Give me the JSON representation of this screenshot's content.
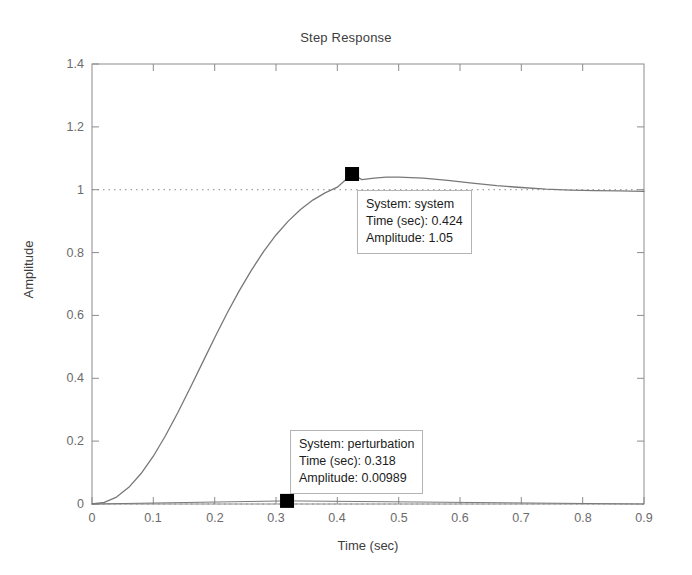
{
  "figure": {
    "title": "Step Response",
    "background_color": "#ffffff",
    "axis_color": "#8c8c8c",
    "curve_color": "#787878",
    "marker_color": "#000000",
    "tick_text_color": "#6b6b6b",
    "label_text_color": "#3d3d3d"
  },
  "chart_data": {
    "type": "line",
    "title": "Step Response",
    "xlabel": "Time (sec)",
    "ylabel": "Amplitude",
    "xlim": [
      0,
      0.9
    ],
    "ylim": [
      0,
      1.4
    ],
    "grid": false,
    "legend": "none",
    "xticks": [
      "0",
      "0.1",
      "0.2",
      "0.3",
      "0.4",
      "0.5",
      "0.6",
      "0.7",
      "0.8",
      "0.9"
    ],
    "xtick_values": [
      0,
      0.1,
      0.2,
      0.3,
      0.4,
      0.5,
      0.6,
      0.7,
      0.8,
      0.9
    ],
    "yticks": [
      "0",
      "0.2",
      "0.4",
      "0.6",
      "0.8",
      "1",
      "1.2",
      "1.4"
    ],
    "ytick_values": [
      0,
      0.2,
      0.4,
      0.6,
      0.8,
      1.0,
      1.2,
      1.4
    ],
    "reference_lines": [
      {
        "name": "steady-state",
        "axis": "y",
        "value": 1.0,
        "style": "dotted"
      },
      {
        "name": "zero-baseline",
        "axis": "y",
        "value": 0.0,
        "style": "dotted"
      }
    ],
    "series": [
      {
        "name": "system",
        "x": [
          0,
          0.02,
          0.04,
          0.06,
          0.08,
          0.1,
          0.12,
          0.14,
          0.16,
          0.18,
          0.2,
          0.22,
          0.24,
          0.26,
          0.28,
          0.3,
          0.32,
          0.34,
          0.36,
          0.38,
          0.4,
          0.424,
          0.44,
          0.46,
          0.48,
          0.5,
          0.54,
          0.58,
          0.62,
          0.66,
          0.7,
          0.74,
          0.78,
          0.82,
          0.86,
          0.9
        ],
        "y": [
          0.0,
          0.005,
          0.022,
          0.053,
          0.097,
          0.152,
          0.218,
          0.291,
          0.369,
          0.449,
          0.529,
          0.606,
          0.678,
          0.744,
          0.804,
          0.856,
          0.9,
          0.937,
          0.967,
          0.99,
          1.008,
          1.05,
          1.032,
          1.037,
          1.04,
          1.04,
          1.037,
          1.03,
          1.021,
          1.013,
          1.007,
          1.002,
          0.999,
          0.997,
          0.996,
          0.995
        ]
      },
      {
        "name": "perturbation",
        "x": [
          0,
          0.318,
          0.9
        ],
        "y": [
          0.0,
          0.00989,
          0.0
        ]
      }
    ],
    "markers": [
      {
        "name": "system-peak-marker",
        "x": 0.424,
        "y": 1.05,
        "shape": "square",
        "color": "#000000"
      },
      {
        "name": "perturbation-marker",
        "x": 0.318,
        "y": 0.00989,
        "shape": "square",
        "color": "#000000"
      }
    ]
  },
  "datatips": [
    {
      "id": "system-datatip",
      "system_label": "System: system",
      "time_label": "Time (sec): 0.424",
      "amplitude_label": "Amplitude: 1.05"
    },
    {
      "id": "perturbation-datatip",
      "system_label": "System: perturbation",
      "time_label": "Time (sec): 0.318",
      "amplitude_label": "Amplitude: 0.00989"
    }
  ]
}
